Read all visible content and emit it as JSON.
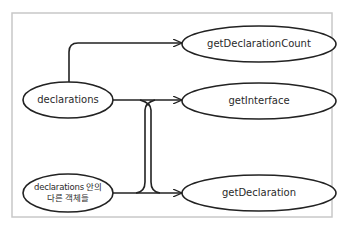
{
  "diagram": {
    "frame_color": "#c8c8c8",
    "line_color": "#222222",
    "sources": [
      {
        "id": "declarations",
        "label": "declarations"
      },
      {
        "id": "other-objects",
        "label_line1": "declarations 안의",
        "label_line2": "다른 객체들"
      }
    ],
    "targets": [
      {
        "id": "getDeclarationCount",
        "label": "getDeclarationCount"
      },
      {
        "id": "getInterface",
        "label": "getInterface"
      },
      {
        "id": "getDeclaration",
        "label": "getDeclaration"
      }
    ],
    "edges": [
      {
        "from": "declarations",
        "to": "getDeclarationCount"
      },
      {
        "from": "declarations",
        "to": "getInterface"
      },
      {
        "from": "declarations",
        "to": "getDeclaration"
      },
      {
        "from": "other-objects",
        "to": "getInterface"
      },
      {
        "from": "other-objects",
        "to": "getDeclaration"
      }
    ]
  }
}
